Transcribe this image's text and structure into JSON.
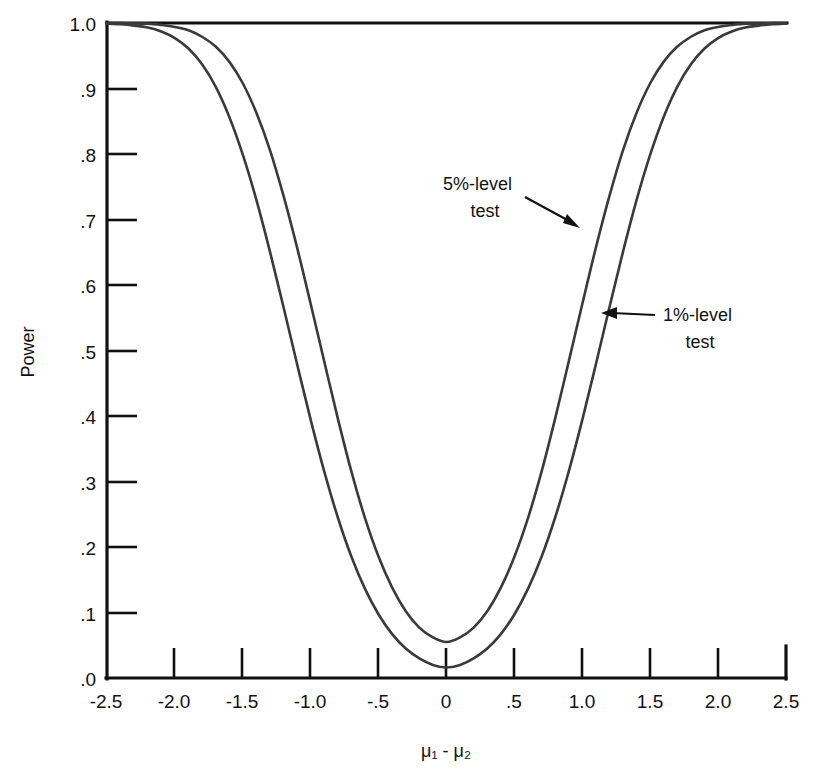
{
  "chart_data": {
    "type": "line",
    "title": "",
    "xlabel": "μ₁ - μ₂",
    "ylabel": "Power",
    "xlim": [
      -2.5,
      2.5
    ],
    "ylim": [
      0.0,
      1.0
    ],
    "grid": false,
    "legend_position": "inline-annotations",
    "x_tick_labels": [
      "-2.5",
      "-2.0",
      "-1.5",
      "-1.0",
      "-.5",
      "0",
      ".5",
      "1.0",
      "1.5",
      "2.0",
      "2.5"
    ],
    "x_tick_values": [
      -2.5,
      -2.0,
      -1.5,
      -1.0,
      -0.5,
      0,
      0.5,
      1.0,
      1.5,
      2.0,
      2.5
    ],
    "y_tick_labels": [
      ".0",
      ".1",
      ".2",
      ".3",
      ".4",
      ".5",
      ".6",
      ".7",
      ".8",
      ".9",
      "1.0"
    ],
    "y_tick_values": [
      0.0,
      0.1,
      0.2,
      0.3,
      0.4,
      0.5,
      0.6,
      0.7,
      0.8,
      0.9,
      1.0
    ],
    "x": [
      -2.5,
      -2.4,
      -2.3,
      -2.2,
      -2.1,
      -2.0,
      -1.9,
      -1.8,
      -1.7,
      -1.6,
      -1.5,
      -1.4,
      -1.3,
      -1.2,
      -1.1,
      -1.0,
      -0.9,
      -0.8,
      -0.7,
      -0.6,
      -0.5,
      -0.4,
      -0.3,
      -0.2,
      -0.1,
      0.0,
      0.1,
      0.2,
      0.3,
      0.4,
      0.5,
      0.6,
      0.7,
      0.8,
      0.9,
      1.0,
      1.1,
      1.2,
      1.3,
      1.4,
      1.5,
      1.6,
      1.7,
      1.8,
      1.9,
      2.0,
      2.1,
      2.2,
      2.3,
      2.4,
      2.5
    ],
    "series": [
      {
        "name": "5%-level test",
        "color": "#3a3a3a",
        "values": [
          1.0,
          1.0,
          0.999,
          0.999,
          0.997,
          0.994,
          0.989,
          0.979,
          0.964,
          0.941,
          0.908,
          0.863,
          0.806,
          0.736,
          0.657,
          0.571,
          0.483,
          0.396,
          0.315,
          0.244,
          0.185,
          0.138,
          0.102,
          0.077,
          0.062,
          0.055,
          0.062,
          0.077,
          0.102,
          0.138,
          0.185,
          0.244,
          0.315,
          0.396,
          0.483,
          0.571,
          0.657,
          0.736,
          0.806,
          0.863,
          0.908,
          0.941,
          0.964,
          0.979,
          0.989,
          0.994,
          0.997,
          0.999,
          0.999,
          1.0,
          1.0
        ]
      },
      {
        "name": "1%-level test",
        "color": "#3a3a3a",
        "values": [
          0.999,
          0.998,
          0.996,
          0.993,
          0.987,
          0.977,
          0.961,
          0.937,
          0.903,
          0.857,
          0.799,
          0.73,
          0.651,
          0.566,
          0.479,
          0.394,
          0.315,
          0.245,
          0.185,
          0.136,
          0.097,
          0.067,
          0.045,
          0.03,
          0.02,
          0.016,
          0.02,
          0.03,
          0.045,
          0.067,
          0.097,
          0.136,
          0.185,
          0.245,
          0.315,
          0.394,
          0.479,
          0.566,
          0.651,
          0.73,
          0.799,
          0.857,
          0.903,
          0.937,
          0.961,
          0.977,
          0.987,
          0.993,
          0.996,
          0.998,
          0.999
        ]
      }
    ],
    "annotations": [
      {
        "label_line1": "5%-level",
        "label_line2": "test",
        "text_x": 465,
        "text_y": 190,
        "arrow_from_x": 525,
        "arrow_from_y": 198,
        "arrow_to_x": 578,
        "arrow_to_y": 227
      },
      {
        "label_line1": "1%-level",
        "label_line2": "test",
        "text_x": 660,
        "text_y": 321,
        "arrow_from_x": 652,
        "arrow_from_y": 315,
        "arrow_to_x": 600,
        "arrow_to_y": 313
      }
    ]
  }
}
